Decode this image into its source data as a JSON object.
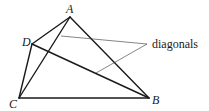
{
  "diagram": {
    "type": "quadrilateral-with-diagonals",
    "vertices": [
      {
        "name": "A",
        "x": 70,
        "y": 17,
        "label_x": 66,
        "label_y": 13
      },
      {
        "name": "B",
        "x": 149,
        "y": 98,
        "label_x": 152,
        "label_y": 104
      },
      {
        "name": "C",
        "x": 19,
        "y": 98,
        "label_x": 9,
        "label_y": 108
      },
      {
        "name": "D",
        "x": 32,
        "y": 44,
        "label_x": 22,
        "label_y": 46
      }
    ],
    "sides": [
      {
        "from": "A",
        "to": "B"
      },
      {
        "from": "B",
        "to": "C"
      },
      {
        "from": "C",
        "to": "D"
      },
      {
        "from": "D",
        "to": "A"
      }
    ],
    "diagonals": [
      {
        "from": "A",
        "to": "C"
      },
      {
        "from": "D",
        "to": "B"
      }
    ],
    "annotation": {
      "text": "diagonals",
      "x": 152,
      "y": 48,
      "anchor": {
        "x": 147,
        "y": 44
      },
      "leader_targets": [
        {
          "x": 61,
          "y": 36
        },
        {
          "x": 96,
          "y": 73
        }
      ]
    },
    "colors": {
      "stroke": "#1a1a1a",
      "leader": "#333333",
      "background": "#ffffff"
    }
  }
}
